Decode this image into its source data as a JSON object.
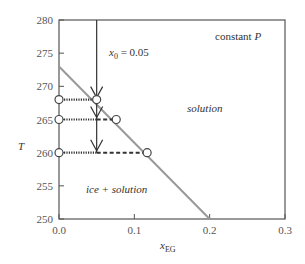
{
  "chart_data": {
    "type": "line",
    "title": "",
    "xlabel": "x",
    "xlabel_sub": "EG",
    "ylabel": "T",
    "xlim": [
      0.0,
      0.3
    ],
    "ylim": [
      250,
      280
    ],
    "xticks": [
      0.0,
      0.1,
      0.2,
      0.3
    ],
    "xtick_labels": [
      "0.0",
      "0.1",
      "0.2",
      "0.3"
    ],
    "yticks": [
      250,
      255,
      260,
      265,
      270,
      275,
      280
    ],
    "ytick_labels": [
      "250",
      "255",
      "260",
      "265",
      "270",
      "275",
      "280"
    ],
    "grid": false,
    "series": [
      {
        "name": "liquidus",
        "color": "#999999",
        "x": [
          0.0,
          0.2
        ],
        "y": [
          273,
          250
        ]
      }
    ],
    "composition_line": {
      "x0": 0.05,
      "label_main": "x",
      "label_sub": "0",
      "label_rest": " = 0.05"
    },
    "tie_lines": [
      {
        "T": 268,
        "x_end": 0.05
      },
      {
        "T": 265,
        "x_end": 0.076
      },
      {
        "T": 260,
        "x_end": 0.117
      }
    ],
    "arrows": [
      {
        "x": 0.05,
        "T": 268
      },
      {
        "x": 0.05,
        "T": 265
      },
      {
        "x": 0.05,
        "T": 260
      }
    ],
    "annotations": {
      "constant_p": "constant ",
      "constant_p_var": "P",
      "solution": "solution",
      "ice_solution": "ice + solution"
    }
  }
}
